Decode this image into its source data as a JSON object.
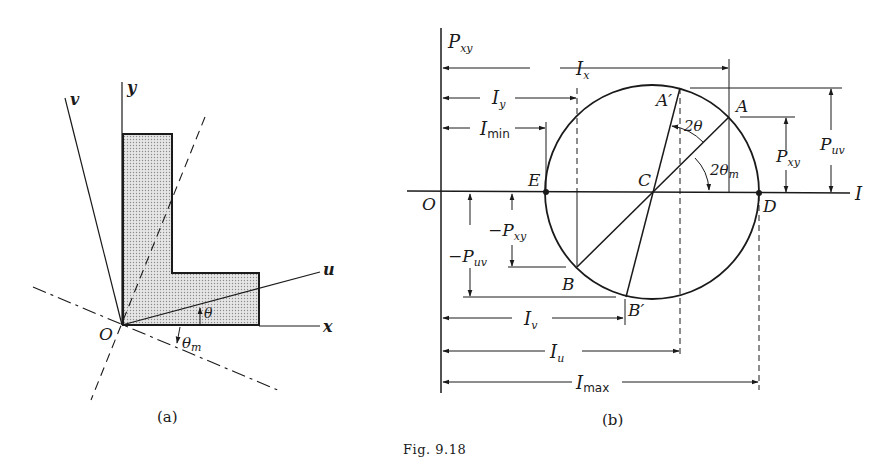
{
  "figure": {
    "caption": "Fig. 9.18",
    "colors": {
      "ink": "#1a1a1a",
      "fill": "#d8d8d8",
      "background": "#ffffff"
    }
  },
  "panel_a": {
    "label": "(a)",
    "axes": {
      "x": "x",
      "y": "y",
      "u": "u",
      "v": "v"
    },
    "origin": "O",
    "angles": {
      "theta": "θ",
      "theta_m": "θ",
      "theta_m_sub": "m"
    },
    "shape": "L-section (shaded)"
  },
  "panel_b": {
    "label": "(b)",
    "axes": {
      "vertical": "P",
      "vertical_sub": "xy",
      "horizontal": "I"
    },
    "points": {
      "O": "O",
      "E": "E",
      "C": "C",
      "D": "D",
      "A": "A",
      "A_prime": "A′",
      "B": "B",
      "B_prime": "B′"
    },
    "angles": {
      "two_theta": "2θ",
      "two_theta_m": "2θ",
      "two_theta_m_sub": "m"
    },
    "dimensions": {
      "Ix": "I",
      "Ix_sub": "x",
      "Iy": "I",
      "Iy_sub": "y",
      "Imin": "I",
      "Imin_sub": "min",
      "Iv": "I",
      "Iv_sub": "v",
      "Iu": "I",
      "Iu_sub": "u",
      "Imax": "I",
      "Imax_sub": "max",
      "Pxy": "P",
      "Pxy_sub": "xy",
      "Puv": "P",
      "Puv_sub": "uv",
      "neg_Pxy": "−P",
      "neg_Pxy_sub": "xy",
      "neg_Puv": "−P",
      "neg_Puv_sub": "uv"
    }
  }
}
